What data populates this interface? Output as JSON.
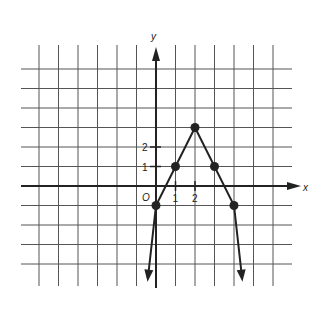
{
  "chart_data": {
    "type": "line",
    "title": "",
    "function": "y = -2|x - 2| + 3",
    "xlabel": "x",
    "ylabel": "y",
    "origin_label": "O",
    "x_tick_labels": [
      "1",
      "2"
    ],
    "y_tick_labels": [
      "1",
      "2"
    ],
    "xlim": [
      -6,
      6
    ],
    "ylim": [
      -5,
      6
    ],
    "grid": true,
    "series": [
      {
        "name": "absolute value graph",
        "x": [
          -0.4,
          0,
          1,
          2,
          3,
          4,
          4.4
        ],
        "y": [
          -4.6,
          -1,
          1,
          3,
          1,
          -1,
          -4.6
        ],
        "marked_points": [
          [
            0,
            -1
          ],
          [
            1,
            1
          ],
          [
            2,
            3
          ],
          [
            3,
            1
          ],
          [
            4,
            -1
          ]
        ],
        "arrows_on_ends": true
      }
    ]
  }
}
